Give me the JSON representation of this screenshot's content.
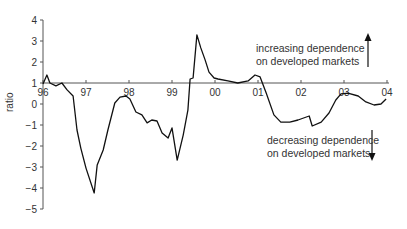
{
  "chart_data": {
    "type": "line",
    "title": "",
    "xlabel": "",
    "ylabel": "ratio",
    "ylim": [
      -5,
      4
    ],
    "xlim": [
      1996,
      2004
    ],
    "x_axis_crosses_at": 1,
    "grid": false,
    "legend": null,
    "x_tick_labels": [
      "96",
      "97",
      "98",
      "99",
      "00",
      "01",
      "02",
      "03",
      "04"
    ],
    "y_tick_labels": [
      "4",
      "3",
      "2",
      "1",
      "0",
      "−1",
      "−2",
      "−3",
      "−4",
      "−5"
    ],
    "y_ticks": [
      4,
      3,
      2,
      1,
      0,
      -1,
      -2,
      -3,
      -4,
      -5
    ],
    "series": [
      {
        "name": "ratio",
        "color": "#111111",
        "points": [
          [
            1996.0,
            0.95
          ],
          [
            1996.09,
            1.38
          ],
          [
            1996.16,
            1.0
          ],
          [
            1996.3,
            0.86
          ],
          [
            1996.44,
            1.0
          ],
          [
            1996.56,
            0.67
          ],
          [
            1996.7,
            0.38
          ],
          [
            1996.79,
            -1.24
          ],
          [
            1996.88,
            -2.1
          ],
          [
            1997.0,
            -3.05
          ],
          [
            1997.19,
            -4.24
          ],
          [
            1997.26,
            -2.9
          ],
          [
            1997.4,
            -2.19
          ],
          [
            1997.51,
            -1.24
          ],
          [
            1997.67,
            0.05
          ],
          [
            1997.79,
            0.33
          ],
          [
            1997.93,
            0.38
          ],
          [
            1998.02,
            0.24
          ],
          [
            1998.16,
            -0.38
          ],
          [
            1998.3,
            -0.52
          ],
          [
            1998.42,
            -0.9
          ],
          [
            1998.53,
            -0.76
          ],
          [
            1998.65,
            -0.81
          ],
          [
            1998.77,
            -1.38
          ],
          [
            1998.91,
            -1.62
          ],
          [
            1999.0,
            -1.14
          ],
          [
            1999.12,
            -2.67
          ],
          [
            1999.26,
            -1.48
          ],
          [
            1999.37,
            -0.29
          ],
          [
            1999.42,
            1.19
          ],
          [
            1999.49,
            1.24
          ],
          [
            1999.58,
            3.29
          ],
          [
            1999.67,
            2.67
          ],
          [
            1999.77,
            2.1
          ],
          [
            1999.86,
            1.52
          ],
          [
            1999.98,
            1.24
          ],
          [
            2000.07,
            1.19
          ],
          [
            2000.3,
            1.1
          ],
          [
            2000.53,
            1.0
          ],
          [
            2000.77,
            1.1
          ],
          [
            2000.93,
            1.38
          ],
          [
            2001.05,
            1.29
          ],
          [
            2001.19,
            0.52
          ],
          [
            2001.37,
            -0.52
          ],
          [
            2001.53,
            -0.86
          ],
          [
            2001.74,
            -0.86
          ],
          [
            2001.93,
            -0.76
          ],
          [
            2002.19,
            -0.57
          ],
          [
            2002.26,
            -1.05
          ],
          [
            2002.47,
            -0.86
          ],
          [
            2002.65,
            -0.43
          ],
          [
            2002.81,
            0.19
          ],
          [
            2002.93,
            0.48
          ],
          [
            2003.09,
            0.52
          ],
          [
            2003.33,
            0.38
          ],
          [
            2003.51,
            0.1
          ],
          [
            2003.7,
            -0.05
          ],
          [
            2003.86,
            0.0
          ],
          [
            2003.98,
            0.24
          ]
        ]
      }
    ],
    "annotations": [
      {
        "text_line1": "increasing dependence",
        "text_line2": "on developed markets",
        "arrow": "up"
      },
      {
        "text_line1": "decreasing dependence",
        "text_line2": "on developed markets",
        "arrow": "down"
      }
    ]
  },
  "labels": {
    "ylabel": "ratio",
    "up_line1": "increasing dependence",
    "up_line2": "on developed markets",
    "down_line1": "decreasing dependence",
    "down_line2": "on developed markets"
  }
}
